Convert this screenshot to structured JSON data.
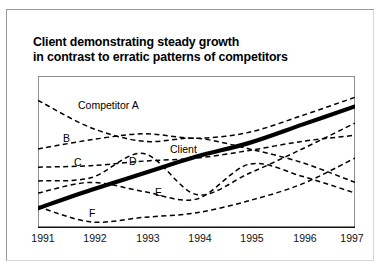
{
  "page": {
    "background_color": "#ffffff",
    "frame_color": "#9a9a9a"
  },
  "title": {
    "line1": "Client demonstrating steady growth",
    "line2": "in contrast to erratic patterns of competitors"
  },
  "chart_data": {
    "type": "line",
    "title": "Client demonstrating steady growth in contrast to erratic patterns of competitors",
    "xlabel": "",
    "ylabel": "",
    "x": [
      1991,
      1992,
      1993,
      1994,
      1995,
      1996,
      1997
    ],
    "xticklabels": [
      "1991",
      "1992",
      "1993",
      "1994",
      "1995",
      "1996",
      "1997"
    ],
    "xlim": [
      1991,
      1997
    ],
    "ylim": [
      0,
      100
    ],
    "yticklabels": [],
    "grid": false,
    "legend": "inline-labels",
    "axis_style": "bottom-and-box-frame",
    "series": [
      {
        "name": "Client",
        "style": "solid-bold",
        "color": "#000000",
        "label_position": {
          "x": 1994.0,
          "y": 64
        },
        "values": [
          13,
          25,
          36,
          47,
          56,
          68,
          80
        ]
      },
      {
        "name": "Competitor A",
        "style": "dashed",
        "color": "#000000",
        "label_position": {
          "x": 1992.3,
          "y": 76
        },
        "values": [
          84,
          66,
          57,
          59,
          52,
          43,
          30
        ]
      },
      {
        "name": "B",
        "style": "dashed",
        "color": "#000000",
        "label_position": {
          "x": 1991.5,
          "y": 57
        },
        "values": [
          52,
          58,
          62,
          59,
          63,
          74,
          86
        ]
      },
      {
        "name": "C",
        "style": "dashed",
        "color": "#000000",
        "label_position": {
          "x": 1991.9,
          "y": 48
        },
        "values": [
          40,
          41,
          44,
          46,
          51,
          57,
          61
        ]
      },
      {
        "name": "D",
        "style": "dashed",
        "color": "#000000",
        "label_position": {
          "x": 1992.95,
          "y": 49
        },
        "values": [
          31,
          33,
          49,
          22,
          36,
          52,
          69
        ]
      },
      {
        "name": "E",
        "style": "dashed",
        "color": "#000000",
        "label_position": {
          "x": 1993.55,
          "y": 30
        },
        "values": [
          23,
          30,
          24,
          19,
          42,
          34,
          23
        ]
      },
      {
        "name": "F",
        "style": "dashed",
        "color": "#000000",
        "label_position": {
          "x": 1992.2,
          "y": 17
        },
        "values": [
          14,
          4,
          7,
          10,
          18,
          29,
          46
        ]
      }
    ]
  },
  "series_labels": [
    {
      "name": "competitor-a",
      "text": "Competitor A",
      "left": 78,
      "top": 99
    },
    {
      "name": "b",
      "text": "B",
      "left": 63,
      "top": 132
    },
    {
      "name": "c",
      "text": "C",
      "left": 74,
      "top": 156
    },
    {
      "name": "d",
      "text": "D",
      "left": 129,
      "top": 155
    },
    {
      "name": "client",
      "text": "Client",
      "left": 170,
      "top": 143
    },
    {
      "name": "e",
      "text": "E",
      "left": 155,
      "top": 186
    },
    {
      "name": "f",
      "text": "F",
      "left": 89,
      "top": 207
    }
  ],
  "x_axis": {
    "ticks": [
      {
        "label": "1991",
        "left": 43
      },
      {
        "label": "1992",
        "left": 95
      },
      {
        "label": "1993",
        "left": 148
      },
      {
        "label": "1994",
        "left": 200
      },
      {
        "label": "1995",
        "left": 252
      },
      {
        "label": "1996",
        "left": 305
      },
      {
        "label": "1997",
        "left": 352
      }
    ]
  }
}
